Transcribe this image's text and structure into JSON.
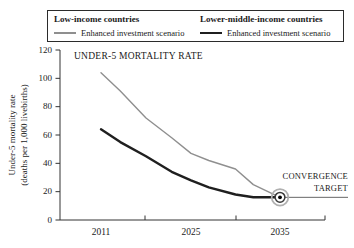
{
  "colors": {
    "low_income_line": "#8f8f8f",
    "lower_middle_income_line": "#1f1f1f",
    "axis": "#333333",
    "legend_border": "#2b2b2b",
    "annotation_line": "#555555",
    "target_outer_ring": "#b0b0b0",
    "target_mid_ring": "#3a3a3a",
    "target_dot": "#000000"
  },
  "legend": {
    "series": [
      {
        "title": "Low-income countries",
        "scenario_label": "Enhanced investment scenario",
        "color": "#8f8f8f",
        "sample_thickness": 1.5
      },
      {
        "title": "Lower-middle-income countries",
        "scenario_label": "Enhanced investment scenario",
        "color": "#1f1f1f",
        "sample_thickness": 2.5
      }
    ]
  },
  "chart_data": {
    "type": "line",
    "title": "UNDER-5 MORTALITY RATE",
    "xlabel": "",
    "ylabel": "Under-5 mortality rate (deaths per 1,000 livebirths)",
    "ylabel_line1": "Under-5 mortality rate",
    "ylabel_line2": "(deaths per 1,000 livebirths)",
    "x_tick_labels": [
      "2011",
      "2025",
      "2035"
    ],
    "x_tick_years": [
      2011,
      2025,
      2035
    ],
    "y_ticks": [
      0,
      20,
      40,
      60,
      80,
      100,
      120
    ],
    "ylim": [
      0,
      120
    ],
    "grid": false,
    "legend_position": "top",
    "series": [
      {
        "name": "Low-income countries — Enhanced investment scenario",
        "color": "#8f8f8f",
        "width": 1.4,
        "points": [
          [
            2011,
            104
          ],
          [
            2014,
            91
          ],
          [
            2018,
            72
          ],
          [
            2022,
            58
          ],
          [
            2025,
            47
          ],
          [
            2027,
            42
          ],
          [
            2030,
            36
          ],
          [
            2032,
            25
          ],
          [
            2035,
            16
          ]
        ]
      },
      {
        "name": "Lower-middle-income countries — Enhanced investment scenario",
        "color": "#1f1f1f",
        "width": 2.4,
        "points": [
          [
            2011,
            64
          ],
          [
            2014,
            55
          ],
          [
            2018,
            45
          ],
          [
            2022,
            34
          ],
          [
            2025,
            28
          ],
          [
            2027,
            23
          ],
          [
            2030,
            18
          ],
          [
            2032,
            16
          ],
          [
            2035,
            16
          ]
        ]
      }
    ],
    "annotation": {
      "label_line1": "CONVERGENCE",
      "label_line2": "TARGET",
      "x": 2035,
      "y": 16
    }
  }
}
